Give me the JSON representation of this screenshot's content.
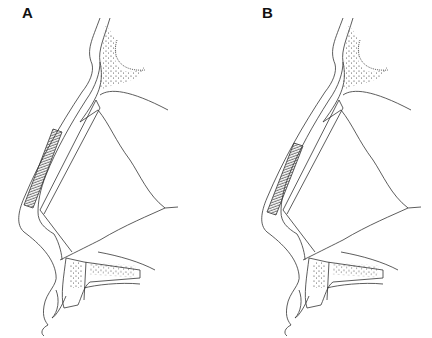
{
  "figure": {
    "panels": [
      {
        "label": "A",
        "dx": 0,
        "graft": {
          "x1": 47,
          "y1": 210,
          "x2": 77,
          "y2": 132,
          "w": 9
        }
      },
      {
        "label": "B",
        "dx": 243,
        "graft": {
          "x1": 24,
          "y1": 213,
          "x2": 52,
          "y2": 146,
          "w": 9
        }
      }
    ],
    "colors": {
      "line": "#333333",
      "background": "#ffffff"
    }
  }
}
